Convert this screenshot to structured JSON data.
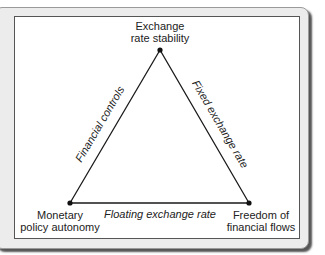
{
  "diagram": {
    "vertices": {
      "top": {
        "line1": "Exchange",
        "line2": "rate stability"
      },
      "bottom_left": {
        "line1": "Monetary",
        "line2": "policy autonomy"
      },
      "bottom_right": {
        "line1": "Freedom of",
        "line2": "financial flows"
      }
    },
    "edges": {
      "left": "Financial controls",
      "right": "Fixed exchange rate",
      "bottom": "Floating exchange rate"
    },
    "colors": {
      "line": "#1a1a1a",
      "panel": "#ececec",
      "box": "#ffffff"
    }
  }
}
